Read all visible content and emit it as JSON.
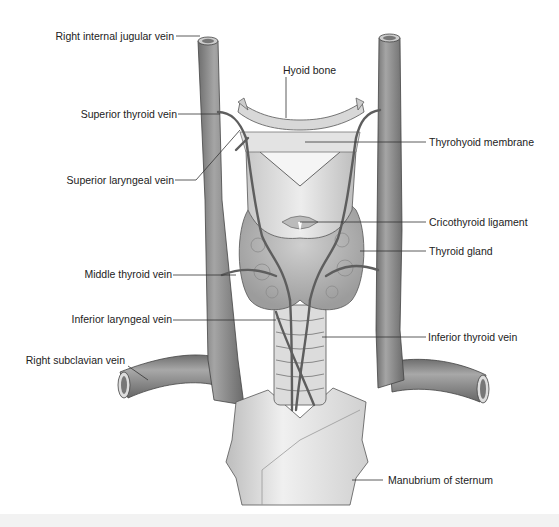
{
  "figure": {
    "labels_left": [
      {
        "id": "right-internal-jugular-vein",
        "text": "Right internal jugular vein",
        "x": 206,
        "y": 32
      },
      {
        "id": "superior-thyroid-vein",
        "text": "Superior thyroid vein",
        "x": 170,
        "y": 113
      },
      {
        "id": "superior-laryngeal-vein",
        "text": "Superior laryngeal vein",
        "x": 170,
        "y": 179
      },
      {
        "id": "middle-thyroid-vein",
        "text": "Middle thyroid vein",
        "x": 170,
        "y": 274
      },
      {
        "id": "inferior-laryngeal-vein",
        "text": "Inferior laryngeal vein",
        "x": 170,
        "y": 319
      },
      {
        "id": "right-subclavian-vein",
        "text": "Right subclavian vein",
        "x": 124,
        "y": 360
      }
    ],
    "labels_right": [
      {
        "id": "hyoid-bone",
        "text": "Hyoid bone",
        "x": 285,
        "y": 70
      },
      {
        "id": "thyrohyoid-membrane",
        "text": "Thyrohyoid membrane",
        "x": 428,
        "y": 142
      },
      {
        "id": "cricothyroid-ligament",
        "text": "Cricothyroid ligament",
        "x": 428,
        "y": 222
      },
      {
        "id": "thyroid-gland",
        "text": "Thyroid gland",
        "x": 428,
        "y": 251
      },
      {
        "id": "inferior-thyroid-vein",
        "text": "Inferior thyroid vein",
        "x": 428,
        "y": 337
      },
      {
        "id": "manubrium-of-sternum",
        "text": "Manubrium of sternum",
        "x": 388,
        "y": 487
      }
    ]
  },
  "colors": {
    "vein_fill": "#8a8a8a",
    "vein_dark": "#5a5a5a",
    "tissue_light": "#d9d9d9",
    "tissue_mid": "#b5b5b5",
    "leader": "#333333",
    "text": "#222222"
  }
}
